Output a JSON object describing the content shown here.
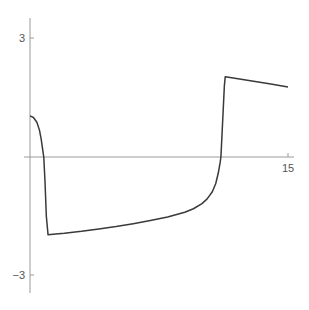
{
  "chart_data": {
    "type": "line",
    "title": "",
    "xlabel": "",
    "ylabel": "",
    "xlim": [
      0,
      15
    ],
    "ylim": [
      -3.4,
      3.5
    ],
    "grid": false,
    "legend": null,
    "x_ticks": [
      {
        "value": 15,
        "label": "15"
      }
    ],
    "y_ticks": [
      {
        "value": 3,
        "label": "3"
      },
      {
        "value": -3,
        "label": "-3"
      }
    ],
    "series": [
      {
        "name": "x(t)",
        "color": "#3a3a3a",
        "x": [
          0,
          0.2,
          0.4,
          0.55,
          0.65,
          0.75,
          0.8,
          0.87,
          0.95,
          1.05,
          1.5,
          2,
          3,
          4,
          5,
          6,
          7,
          8,
          9,
          9.5,
          10,
          10.3,
          10.6,
          10.8,
          10.95,
          11.05,
          11.1,
          11.2,
          11.3,
          11.35,
          12,
          13,
          14,
          15
        ],
        "values": [
          1.04,
          1.0,
          0.88,
          0.68,
          0.45,
          0.15,
          0.0,
          -0.6,
          -1.5,
          -1.97,
          -1.95,
          -1.93,
          -1.88,
          -1.82,
          -1.76,
          -1.69,
          -1.61,
          -1.52,
          -1.4,
          -1.31,
          -1.18,
          -1.06,
          -0.88,
          -0.67,
          -0.4,
          -0.15,
          0.0,
          0.9,
          1.8,
          2.03,
          1.99,
          1.92,
          1.85,
          1.77
        ]
      }
    ]
  },
  "labels": {
    "y_top": "3",
    "y_bottom": "−3",
    "x_right": "15"
  }
}
